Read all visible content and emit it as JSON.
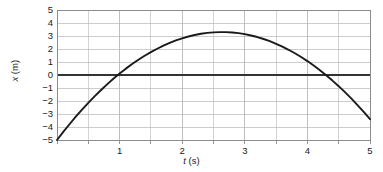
{
  "chart_data": {
    "type": "line",
    "title": "",
    "subtitle": "",
    "xlabel_italic": "t",
    "xlabel_unit": " (s)",
    "ylabel_italic": "x",
    "ylabel_unit": " (m)",
    "xlabel": "t (s)",
    "ylabel": "x (m)",
    "xlim": [
      0,
      5
    ],
    "ylim": [
      -5,
      5
    ],
    "grid": true,
    "grid_minor_x_step": 0.5,
    "grid_major_x_step": 1,
    "grid_y_step": 1,
    "zero_line": 0,
    "legend": null,
    "legend_position": "none",
    "xticks": [
      1,
      2,
      3,
      4,
      5
    ],
    "xtick_labels": [
      "1",
      "2",
      "3",
      "4",
      "5"
    ],
    "yticks": [
      5,
      4,
      3,
      2,
      1,
      0,
      -1,
      -2,
      -3,
      -4,
      -5
    ],
    "ytick_labels": [
      "5",
      "4",
      "3",
      "2",
      "1",
      "0",
      "−1",
      "−2",
      "−3",
      "−4",
      "−5"
    ],
    "annotations": [],
    "series": [
      {
        "name": "position",
        "x": [
          0.0,
          0.1,
          0.2,
          0.3,
          0.4,
          0.5,
          0.6,
          0.7,
          0.8,
          0.9,
          1.0,
          1.1,
          1.2,
          1.3,
          1.4,
          1.5,
          1.6,
          1.7,
          1.8,
          1.9,
          2.0,
          2.1,
          2.2,
          2.3,
          2.4,
          2.5,
          2.6,
          2.7,
          2.8,
          2.9,
          3.0,
          3.1,
          3.2,
          3.3,
          3.4,
          3.5,
          3.6,
          3.7,
          3.8,
          3.9,
          4.0,
          4.1,
          4.2,
          4.3,
          4.4,
          4.5,
          4.6,
          4.7,
          4.8,
          4.9,
          5.0
        ],
        "values": [
          -5.0,
          -4.38,
          -3.79,
          -3.21,
          -2.67,
          -2.14,
          -1.64,
          -1.17,
          -0.72,
          -0.29,
          0.11,
          0.49,
          0.84,
          1.17,
          1.48,
          1.76,
          2.02,
          2.26,
          2.47,
          2.66,
          2.82,
          2.96,
          3.08,
          3.17,
          3.24,
          3.28,
          3.3,
          3.3,
          3.27,
          3.22,
          3.14,
          3.04,
          2.92,
          2.77,
          2.6,
          2.4,
          2.18,
          1.94,
          1.67,
          1.38,
          1.07,
          0.73,
          0.37,
          -0.02,
          -0.43,
          -0.86,
          -1.32,
          -1.8,
          -2.31,
          -2.84,
          -3.4
        ]
      }
    ],
    "curve_description": "Downward-opening parabola: starts at (0, -5), rises through zero near t = 1, peaks at about x = 4.8 m at t = 2.5 s, falls through zero near t = 4, and ends at (5, -5).",
    "curve_model": {
      "form": "x(t) = a*(t - h)^2 + k",
      "a": -1.5728,
      "h": 2.5,
      "k": 4.83,
      "x_at_0": -5.0,
      "x_at_5": -5.0,
      "peak_t": 2.5,
      "peak_x": 4.83,
      "zero_crossings": [
        1.0,
        4.0
      ]
    },
    "colors": {
      "curve": "#1a1a1a",
      "frame": "#8c8c8c",
      "grid": "#b8b8b8",
      "zero_line": "#333333",
      "background": "#ffffff",
      "text": "#1a1a1a"
    },
    "plot_box": {
      "left": 57,
      "right": 370,
      "top": 10,
      "bottom": 140
    }
  }
}
